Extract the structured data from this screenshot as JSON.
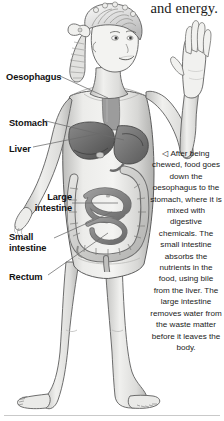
{
  "page": {
    "background_color": "#ffffff",
    "width": 224,
    "height": 421
  },
  "header": {
    "text": "and energy."
  },
  "labels": [
    {
      "name": "oesophagus",
      "text": "Oesophagus",
      "left": 6,
      "top": 72,
      "align": "left"
    },
    {
      "name": "stomach",
      "text": "Stomach",
      "left": 9,
      "top": 118,
      "align": "left"
    },
    {
      "name": "liver",
      "text": "Liver",
      "left": 9,
      "top": 144,
      "align": "left"
    },
    {
      "name": "large-intestine",
      "text": "Large\nintestine",
      "left": 28,
      "top": 192,
      "align": "right"
    },
    {
      "name": "small-intestine",
      "text": "Small\nintestine",
      "left": 9,
      "top": 232,
      "align": "left"
    },
    {
      "name": "rectum",
      "text": "Rectum",
      "left": 9,
      "top": 272,
      "align": "left"
    }
  ],
  "caption": {
    "marker": "◁",
    "text": "After being chewed, food goes down the oesophagus to the stomach, where it is mixed with digestive chemicals. The small intestine absorbs the nutrients in the food, using bile from the liver. The large intestine removes water from the waste matter before it leaves the body."
  },
  "colors": {
    "text": "#1a1a1a",
    "label": "#111111",
    "leader_line": "#5a5a5a",
    "rule": "#c9c9c9",
    "skin_light": "#f2f2f0",
    "skin_mid": "#d8d8d6",
    "skin_shadow": "#b4b4b2",
    "outline": "#4a4a4a",
    "organ_dark": "#6e6e6e",
    "organ_mid": "#9a9a9a",
    "organ_light": "#cfcfcf"
  },
  "illustration": {
    "subject": "girl-standing-with-raised-hand",
    "organs": [
      "oesophagus",
      "stomach",
      "liver",
      "large-intestine",
      "small-intestine",
      "rectum"
    ]
  }
}
